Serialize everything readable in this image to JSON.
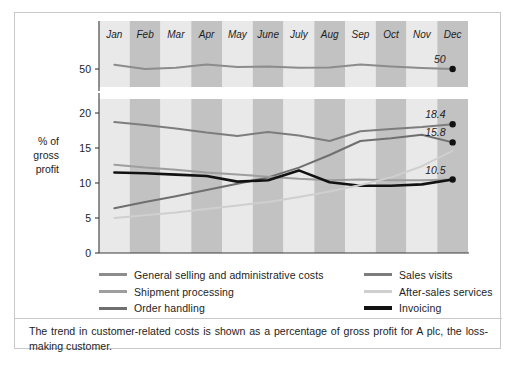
{
  "caption": {
    "text": "The trend in customer-related costs is shown as a percentage of gross profit for A plc, the loss-making customer."
  },
  "figure_footer": {
    "text": ""
  },
  "axis": {
    "y_title_line1": "% of",
    "y_title_line2": "gross",
    "y_title_line3": "profit",
    "lower_ticks": [
      "20",
      "15",
      "10",
      "5",
      "0"
    ],
    "upper_ticks": [
      "50"
    ]
  },
  "legend": {
    "left": [
      {
        "label": "General selling and administrative costs",
        "color": "#8c8c8c"
      },
      {
        "label": "Shipment processing",
        "color": "#9e9e9e"
      },
      {
        "label": "Order handling",
        "color": "#6f6f6f"
      }
    ],
    "right": [
      {
        "label": "Sales visits",
        "color": "#7d7d7d"
      },
      {
        "label": "After-sales services",
        "color": "#cfcfcf"
      },
      {
        "label": "Invoicing",
        "color": "#121212"
      }
    ]
  },
  "colors": {
    "band_light": "#e9e9e9",
    "band_dark": "#c2c2c2",
    "axis": "#3a3a3a",
    "border": "#c9c9c9",
    "text": "#1d1d1d"
  },
  "chart_data": {
    "type": "line",
    "title": "",
    "xlabel": "",
    "ylabel": "% of gross profit",
    "categories": [
      "Jan",
      "Feb",
      "Mar",
      "Apr",
      "May",
      "June",
      "July",
      "Aug",
      "Sep",
      "Oct",
      "Nov",
      "Dec"
    ],
    "broken_axis": true,
    "upper_panel": {
      "ylim": [
        44,
        58
      ],
      "ticks": [
        50
      ]
    },
    "lower_panel": {
      "ylim": [
        0,
        22
      ],
      "ticks": [
        0,
        5,
        10,
        15,
        20
      ]
    },
    "grid": false,
    "legend_position": "bottom",
    "series": [
      {
        "name": "General selling and administrative costs",
        "color": "#8c8c8c",
        "panel": "upper",
        "values": [
          51.4,
          50.0,
          50.4,
          51.5,
          50.7,
          50.8,
          50.4,
          50.5,
          51.5,
          50.8,
          50.3,
          50.0
        ],
        "end_label": "50"
      },
      {
        "name": "Sales visits",
        "color": "#7d7d7d",
        "panel": "lower",
        "values": [
          18.7,
          18.3,
          17.8,
          17.2,
          16.7,
          17.3,
          16.8,
          16.0,
          17.4,
          17.7,
          18.0,
          18.4
        ],
        "end_label": "18.4"
      },
      {
        "name": "Order handling",
        "color": "#6f6f6f",
        "panel": "lower",
        "values": [
          6.4,
          7.3,
          8.1,
          9.0,
          9.9,
          10.8,
          12.2,
          14.0,
          16.0,
          16.4,
          16.9,
          15.8
        ],
        "end_label": "15.8"
      },
      {
        "name": "Shipment processing",
        "color": "#9e9e9e",
        "panel": "lower",
        "values": [
          12.6,
          12.2,
          11.9,
          11.5,
          11.2,
          10.9,
          10.6,
          10.4,
          10.5,
          10.4,
          10.4,
          10.5
        ],
        "end_label": ""
      },
      {
        "name": "Invoicing",
        "color": "#121212",
        "panel": "lower",
        "values": [
          11.5,
          11.4,
          11.2,
          11.0,
          10.2,
          10.4,
          11.8,
          10.1,
          9.6,
          9.6,
          9.8,
          10.5
        ],
        "end_label": "10.5"
      },
      {
        "name": "After-sales services",
        "color": "#cfcfcf",
        "panel": "lower",
        "values": [
          5.0,
          5.4,
          5.8,
          6.3,
          6.8,
          7.3,
          8.0,
          8.8,
          9.7,
          10.8,
          12.4,
          14.6
        ],
        "end_label": ""
      }
    ],
    "end_labels": [
      "50",
      "18.4",
      "15.8",
      "10.5"
    ]
  }
}
